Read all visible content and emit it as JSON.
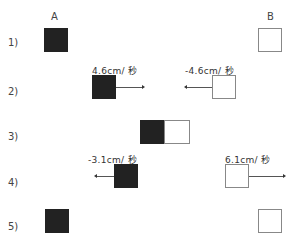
{
  "labels": {
    "a": "A",
    "b": "B"
  },
  "rows": [
    {
      "label": "1)"
    },
    {
      "label": "2)",
      "a_velocity": "4.6cm/ 秒",
      "b_velocity": "-4.6cm/ 秒"
    },
    {
      "label": "3)"
    },
    {
      "label": "4)",
      "a_velocity": "-3.1cm/ 秒",
      "b_velocity": "6.1cm/ 秒"
    },
    {
      "label": "5)"
    }
  ],
  "colors": {
    "block_a": "#222222",
    "block_b": "#ffffff",
    "block_b_border": "#888888"
  }
}
